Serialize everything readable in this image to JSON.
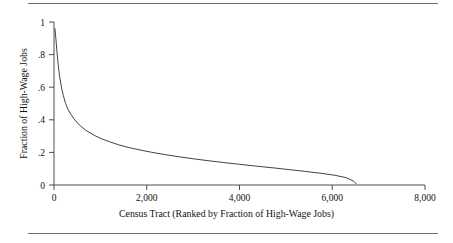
{
  "chart_data": {
    "type": "line",
    "title": "",
    "xlabel": "Census Tract (Ranked by Fraction of High-Wage Jobs)",
    "ylabel": "Fraction of High-Wage Jobs",
    "xlim": [
      0,
      8000
    ],
    "ylim": [
      0,
      1
    ],
    "grid": false,
    "legend": "none",
    "xticks": [
      0,
      2000,
      4000,
      6000,
      8000
    ],
    "xticklabels": [
      "0",
      "2,000",
      "4,000",
      "6,000",
      "8,000"
    ],
    "yticks": [
      0,
      0.2,
      0.4,
      0.6,
      0.8,
      1
    ],
    "yticklabels": [
      "0",
      ".2",
      ".4",
      ".6",
      ".8",
      "1"
    ],
    "series": [
      {
        "name": "Fraction of High-Wage Jobs",
        "color": "#2b2b2b",
        "x": [
          20,
          40,
          60,
          90,
          120,
          160,
          200,
          250,
          300,
          360,
          420,
          500,
          580,
          680,
          780,
          900,
          1050,
          1200,
          1400,
          1600,
          1850,
          2100,
          2400,
          2700,
          3000,
          3300,
          3650,
          4000,
          4350,
          4700,
          5050,
          5400,
          5750,
          6050,
          6300,
          6450,
          6520
        ],
        "y": [
          0.96,
          0.9,
          0.83,
          0.74,
          0.67,
          0.6,
          0.55,
          0.5,
          0.465,
          0.435,
          0.41,
          0.382,
          0.36,
          0.337,
          0.32,
          0.3,
          0.281,
          0.265,
          0.246,
          0.231,
          0.215,
          0.201,
          0.186,
          0.173,
          0.161,
          0.15,
          0.138,
          0.127,
          0.116,
          0.106,
          0.095,
          0.084,
          0.072,
          0.06,
          0.045,
          0.025,
          0.008
        ]
      }
    ]
  },
  "axes": {
    "x_title": "Census Tract (Ranked by Fraction of High-Wage Jobs)",
    "y_title": "Fraction of High-Wage Jobs"
  },
  "ticks": {
    "x": [
      "0",
      "2,000",
      "4,000",
      "6,000",
      "8,000"
    ],
    "y": [
      "1",
      ".8",
      ".6",
      ".4",
      ".2",
      "0"
    ]
  },
  "colors": {
    "line": "#2b2b2b",
    "axis": "#3a3a3a",
    "rule": "#6e6e6e",
    "text": "#111111",
    "background": "#ffffff"
  }
}
